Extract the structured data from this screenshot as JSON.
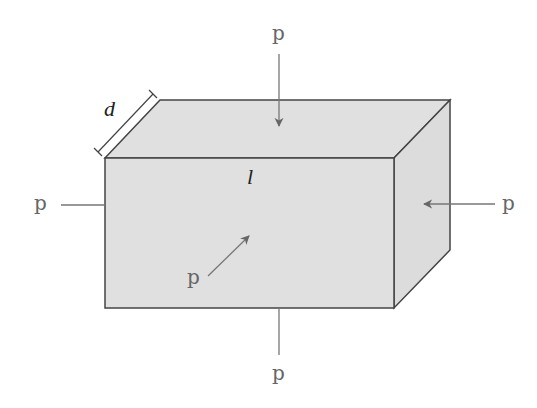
{
  "diagram": {
    "dimension_labels": {
      "depth": "d",
      "length": "l"
    },
    "pressure_labels": {
      "top": "p",
      "bottom": "p",
      "left": "p",
      "right": "p",
      "front": "p"
    },
    "colors": {
      "face_fill": "#e0e0e0",
      "edge": "#444444",
      "arrow": "#777777",
      "text": "#666666"
    }
  }
}
